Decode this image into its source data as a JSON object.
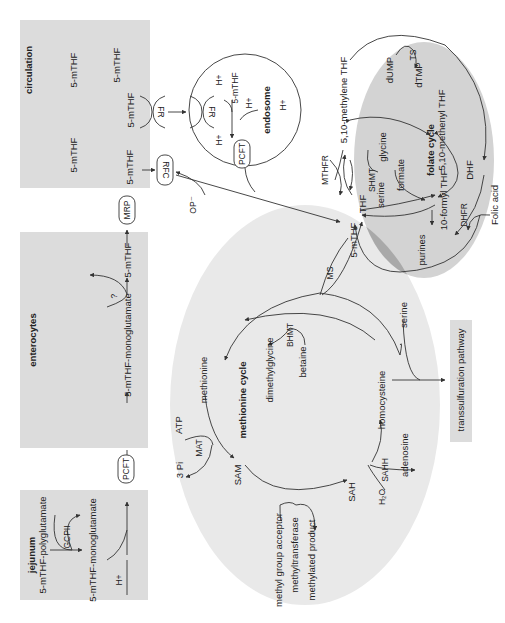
{
  "colors": {
    "compartment_box": "#dcdcdc",
    "methionine_region": "#e9e9e9",
    "folate_region": "#d3d3d3",
    "overlap_region": "#a9a9a9",
    "line": "#333333"
  },
  "compartments": {
    "circulation": {
      "title": "circulation",
      "labels": [
        "5-mTHF",
        "5-mTHF",
        "5-mTHF",
        "5-mTHF",
        "5-mTHF"
      ],
      "receptor": "FR"
    },
    "endosome": {
      "title": "endosome",
      "receptor": "FR",
      "substrate": "5-mTHF",
      "protons": [
        "H+",
        "H+",
        "H+",
        "H+"
      ],
      "transporter": "PCFT"
    },
    "enterocytes": {
      "title": "enterocytes",
      "substrate": "5-mTHF-monoglutamate",
      "unknown_step": "?",
      "product": "5-mTHF"
    },
    "jejunum": {
      "title": "jejunum",
      "polyglutamate": "5-mTHF-polyglutamate",
      "enzyme": "GCPII",
      "monoglutamate": "5-mTHF-monoglutamate",
      "proton": "H+"
    }
  },
  "transporters": {
    "mrp": "MRP",
    "rfc": "RFC",
    "pcft_intestinal": "PCFT",
    "op": "OP⁻"
  },
  "folate_cycle": {
    "title": "folate cycle",
    "nodes": {
      "mthf": "5-mTHF",
      "thf": "THF",
      "methylene": "5,10-methylene THF",
      "methenyl": "5,10-methenyl THF",
      "formyl": "10-formyl THF",
      "dhf": "DHF",
      "dump": "dUMP",
      "dtmp": "dTMP",
      "purines": "purines",
      "formate": "formate",
      "glycine": "glycine",
      "serine": "serine",
      "folic_acid": "Folic acid"
    },
    "enzymes": {
      "mthfr": "MTHFR",
      "shmt": "SHMT",
      "ts": "TS",
      "dhfr": "DHFR"
    }
  },
  "methionine_cycle": {
    "title": "methionine cycle",
    "nodes": {
      "methionine": "methionine",
      "sam": "SAM",
      "sah": "SAH",
      "homocysteine": "homocysteine",
      "atp": "ATP",
      "pi": "3 Pi",
      "adenosine": "adenosine",
      "h2o": "H₂O",
      "dimethylglycine": "dimethylglycine",
      "betaine": "betaine",
      "serine": "serine",
      "acceptor": "methyl group acceptor",
      "methylated": "methylated product"
    },
    "enzymes": {
      "ms": "MS",
      "mat": "MAT",
      "sahh": "SAHH",
      "bhmt": "BHMT",
      "methyltransferase": "methyltransferase"
    }
  },
  "transsulfuration": "transsulfuration pathway"
}
